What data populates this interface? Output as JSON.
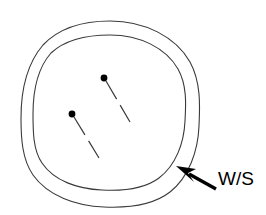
{
  "figure": {
    "type": "technical-line-drawing",
    "background_color": "#ffffff",
    "stroke_color": "#3a3a3a",
    "mark_color": "#000000",
    "width": 266,
    "height": 215
  },
  "annotation": {
    "label": "W/S",
    "label_color": "#000000",
    "arrow_name": "ws-leader-arrow",
    "arrow_points_to": "annular-gap-between-outer-and-inner-ring",
    "arrow_tip": {
      "x": 177,
      "y": 167
    },
    "arrow_tail": {
      "x": 216,
      "y": 189
    }
  },
  "shapes": {
    "outer_ring": {
      "name": "outer-ring",
      "cx": 110.5,
      "cy": 114,
      "rx": 89.5,
      "ry": 93
    },
    "inner_ring": {
      "name": "inner-ring",
      "cx": 109,
      "cy": 112.5,
      "rx": 76,
      "ry": 77.5
    }
  },
  "markers": [
    {
      "name": "pin-marker-upper",
      "dot": {
        "x": 104,
        "y": 78,
        "r": 3.4
      },
      "leader_start": {
        "x": 106,
        "y": 81
      },
      "leader_end": {
        "x": 130,
        "y": 122
      },
      "dashed": true
    },
    {
      "name": "pin-marker-lower",
      "dot": {
        "x": 72,
        "y": 114,
        "r": 3.4
      },
      "leader_start": {
        "x": 74,
        "y": 117
      },
      "leader_end": {
        "x": 99,
        "y": 158
      },
      "dashed": true
    }
  ]
}
